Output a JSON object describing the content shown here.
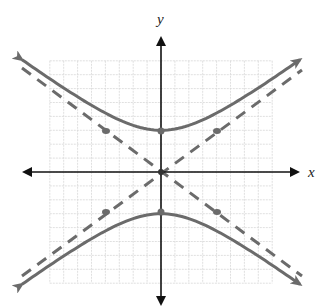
{
  "chart_data": {
    "type": "line",
    "title": "",
    "xlabel": "x",
    "ylabel": "y",
    "grid": true,
    "xlim": [
      -8,
      8
    ],
    "ylim": [
      -8,
      8
    ],
    "equation": "y^2/9 - x^2/16 = 1",
    "series": [
      {
        "name": "hyperbola-upper-branch",
        "style": "solid",
        "points": [
          [
            -9,
            5.6
          ],
          [
            -6,
            4.24
          ],
          [
            -4,
            3.35
          ],
          [
            -2,
            3.35
          ],
          [
            0,
            3
          ],
          [
            2,
            3.35
          ],
          [
            4,
            4.24
          ],
          [
            6,
            5.41
          ],
          [
            9,
            5.6
          ]
        ]
      },
      {
        "name": "hyperbola-lower-branch",
        "style": "solid",
        "points": [
          [
            -9,
            -5.6
          ],
          [
            -6,
            -5.41
          ],
          [
            -4,
            -4.24
          ],
          [
            -2,
            -3.35
          ],
          [
            0,
            -3
          ],
          [
            2,
            -3.35
          ],
          [
            4,
            -4.24
          ],
          [
            6,
            -5.41
          ],
          [
            9,
            -5.6
          ]
        ]
      },
      {
        "name": "asymptote-positive",
        "style": "dashed",
        "slope": 0.75,
        "intercept": 0
      },
      {
        "name": "asymptote-negative",
        "style": "dashed",
        "slope": -0.75,
        "intercept": 0
      }
    ],
    "marked_points": [
      [
        0,
        3
      ],
      [
        0,
        -3
      ],
      [
        0,
        0
      ],
      [
        -4,
        3
      ],
      [
        4,
        3
      ],
      [
        -4,
        -3
      ],
      [
        4,
        -3
      ]
    ]
  },
  "labels": {
    "x_axis": "x",
    "y_axis": "y"
  },
  "colors": {
    "axis": "#111111",
    "curve": "#6b6b6b",
    "grid": "#d8d8d8"
  }
}
